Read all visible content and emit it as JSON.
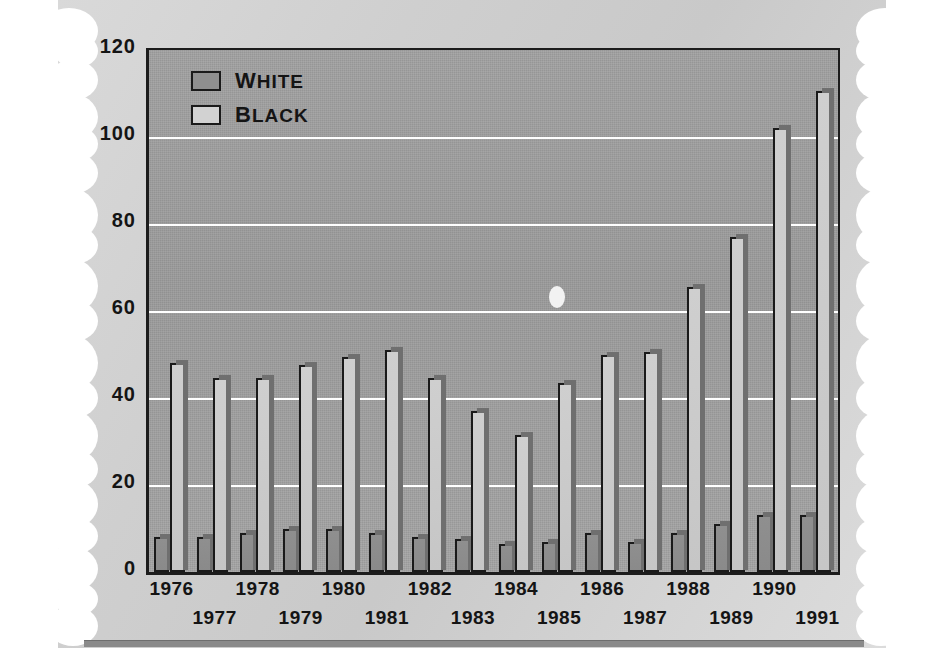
{
  "chart_data": {
    "type": "bar",
    "title": "",
    "xlabel": "",
    "ylabel": "",
    "ylim": [
      0,
      120
    ],
    "yticks": [
      0,
      20,
      40,
      60,
      80,
      100,
      120
    ],
    "grid": "horizontal-white-gridlines-at-20-40-60-80-100",
    "legend_position": "top-left-inside-plot",
    "categories": [
      "1976",
      "1977",
      "1978",
      "1979",
      "1980",
      "1981",
      "1982",
      "1983",
      "1984",
      "1985",
      "1986",
      "1987",
      "1988",
      "1989",
      "1990",
      "1991"
    ],
    "series": [
      {
        "name": "White",
        "values": [
          8,
          8,
          9,
          10,
          10,
          9,
          8,
          7.5,
          6.5,
          7,
          9,
          7,
          9,
          11,
          13,
          13
        ]
      },
      {
        "name": "Black",
        "values": [
          48,
          44.5,
          44.5,
          47.5,
          49.5,
          51,
          44.5,
          37,
          31.5,
          43.5,
          50,
          50.5,
          65.5,
          77,
          102,
          110.5
        ]
      }
    ]
  },
  "legend": {
    "entries": [
      {
        "label": "White",
        "first": "W",
        "rest": "HITE",
        "swatch": "white-series"
      },
      {
        "label": "Black",
        "first": "B",
        "rest": "LACK",
        "swatch": "black-series"
      }
    ]
  },
  "axis": {
    "y_tick_labels": [
      "120",
      "100",
      "80",
      "60",
      "40",
      "20",
      "0"
    ],
    "x_tick_labels_top": [
      "1976",
      "1978",
      "1980",
      "1982",
      "1984",
      "1986",
      "1988",
      "1990"
    ],
    "x_tick_labels_bottom": [
      "1977",
      "1979",
      "1981",
      "1983",
      "1985",
      "1987",
      "1989",
      "1991"
    ]
  },
  "colors": {
    "plot_background": "#9e9e9e",
    "gridline": "#ffffff",
    "axis_line": "#1c1c1c",
    "white_series_fill": "#8f8f8f",
    "black_series_fill": "#cccccc",
    "paper": "#d4d4d4",
    "bottom_rule": "#8a8a8a"
  }
}
